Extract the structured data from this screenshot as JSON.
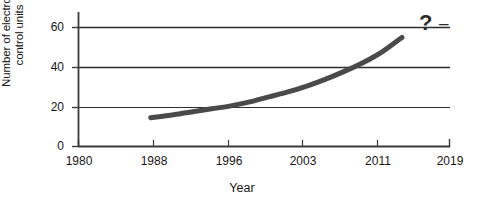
{
  "chart_data": {
    "type": "line",
    "title": "",
    "xlabel": "Year",
    "ylabel_lines": [
      "Number of electronic",
      "control units"
    ],
    "ylabel": "Number of electronic control units",
    "x_ticks": [
      "1980",
      "1988",
      "1996",
      "2003",
      "2011",
      "2019"
    ],
    "y_ticks": [
      "0",
      "20",
      "40",
      "60"
    ],
    "xlim": [
      1980,
      2019
    ],
    "ylim": [
      0,
      60
    ],
    "grid": "horizontal",
    "legend": "none",
    "series": [
      {
        "name": "Number of electronic control units",
        "color": "#4a4a4a",
        "x": [
          1987.6,
          1990,
          1992,
          1994,
          1996,
          1998,
          2000,
          2002,
          2004,
          2006,
          2008,
          2010,
          2012,
          2014
        ],
        "values": [
          14.5,
          16,
          17.5,
          19,
          20.5,
          22.5,
          25,
          27.5,
          30.5,
          34,
          38,
          42.5,
          48,
          55
        ]
      }
    ],
    "annotations": [
      {
        "name": "question-mark",
        "text": "?",
        "x": 2017,
        "y": 61
      },
      {
        "name": "trend-dash",
        "text": "–",
        "x": 2018.5,
        "y": 60
      }
    ]
  },
  "colors": {
    "curve": "#4a4a4a",
    "axis": "#3a3a3a",
    "grid": "#2e2e2e",
    "text": "#161616",
    "background": "#ffffff"
  }
}
